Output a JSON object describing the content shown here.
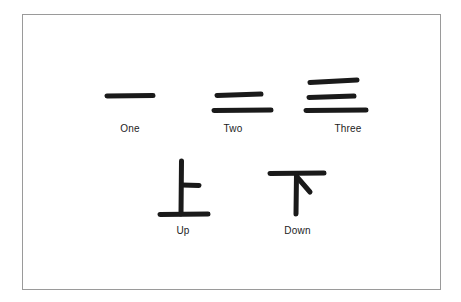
{
  "figure": {
    "background_color": "#ffffff",
    "border_color": "#9a9a9a",
    "ink_color": "#1a1a1a",
    "rows": [
      {
        "name": "numerals-row",
        "items": [
          {
            "label": "One",
            "character": "一",
            "icon_name": "chinese-character-one",
            "stroke_count": 1
          },
          {
            "label": "Two",
            "character": "二",
            "icon_name": "chinese-character-two",
            "stroke_count": 2
          },
          {
            "label": "Three",
            "character": "三",
            "icon_name": "chinese-character-three",
            "stroke_count": 3
          }
        ]
      },
      {
        "name": "directions-row",
        "items": [
          {
            "label": "Up",
            "character": "上",
            "icon_name": "chinese-character-up",
            "stroke_count": 3
          },
          {
            "label": "Down",
            "character": "下",
            "icon_name": "chinese-character-down",
            "stroke_count": 3
          }
        ]
      }
    ]
  }
}
